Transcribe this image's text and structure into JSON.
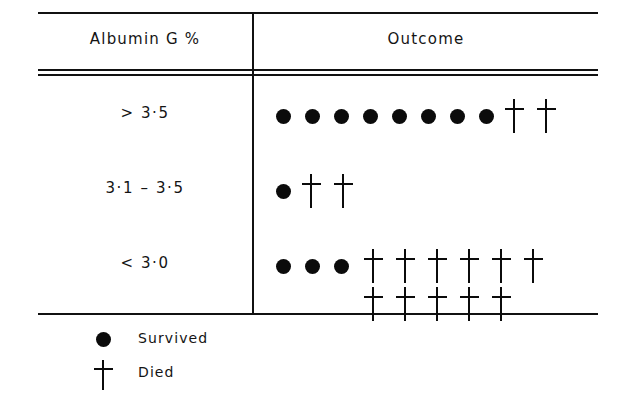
{
  "figure": {
    "title": "",
    "columns": [
      {
        "key": "albumin",
        "header": "Albumin G %"
      },
      {
        "key": "outcome",
        "header": "Outcome"
      }
    ],
    "rows": [
      {
        "label": "> 3·5",
        "survived": 8,
        "died": 2
      },
      {
        "label": "3·1 – 3·5",
        "survived": 1,
        "died": 2
      },
      {
        "label": "< 3·0",
        "survived": 3,
        "died": 11
      }
    ],
    "legend": [
      {
        "symbol": "filled-circle",
        "label": "Survived"
      },
      {
        "symbol": "cross",
        "label": "Died"
      }
    ],
    "colors": {
      "ink": "#0b0b0b",
      "rule": "#111111",
      "background": "#ffffff"
    }
  },
  "chart_data": {
    "type": "table",
    "xlabel": "Outcome",
    "ylabel": "Albumin G %",
    "categories": [
      "> 3·5",
      "3·1 – 3·5",
      "< 3·0"
    ],
    "series": [
      {
        "name": "Survived",
        "symbol": "filled-circle",
        "values": [
          8,
          1,
          3
        ]
      },
      {
        "name": "Died",
        "symbol": "cross",
        "values": [
          2,
          2,
          11
        ]
      }
    ],
    "totals": [
      10,
      3,
      14
    ],
    "units": "patients (one symbol = one patient)",
    "grid": false,
    "legend_position": "bottom-left"
  }
}
